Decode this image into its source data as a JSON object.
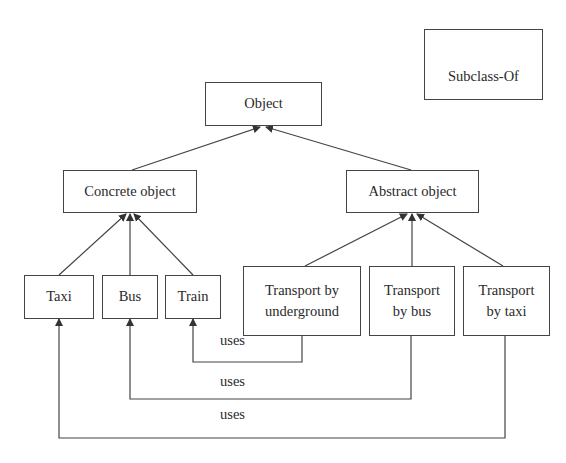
{
  "diagram": {
    "type": "class-hierarchy",
    "legend": {
      "arrow_label": "Subclass-Of"
    },
    "nodes": {
      "object": {
        "label": "Object"
      },
      "concrete": {
        "label": "Concrete object"
      },
      "abstract": {
        "label": "Abstract object"
      },
      "taxi": {
        "label": "Taxi"
      },
      "bus": {
        "label": "Bus"
      },
      "train": {
        "label": "Train"
      },
      "t_underground": {
        "line1": "Transport by",
        "line2": "underground"
      },
      "t_bus": {
        "line1": "Transport",
        "line2": "by bus"
      },
      "t_taxi": {
        "line1": "Transport",
        "line2": "by taxi"
      }
    },
    "edges": [
      {
        "from": "Concrete object",
        "to": "Object",
        "type": "Subclass-Of"
      },
      {
        "from": "Abstract object",
        "to": "Object",
        "type": "Subclass-Of"
      },
      {
        "from": "Taxi",
        "to": "Concrete object",
        "type": "Subclass-Of"
      },
      {
        "from": "Bus",
        "to": "Concrete object",
        "type": "Subclass-Of"
      },
      {
        "from": "Train",
        "to": "Concrete object",
        "type": "Subclass-Of"
      },
      {
        "from": "Transport by underground",
        "to": "Abstract object",
        "type": "Subclass-Of"
      },
      {
        "from": "Transport by bus",
        "to": "Abstract object",
        "type": "Subclass-Of"
      },
      {
        "from": "Transport by taxi",
        "to": "Abstract object",
        "type": "Subclass-Of"
      },
      {
        "from": "Transport by underground",
        "to": "Train",
        "type": "uses"
      },
      {
        "from": "Transport by bus",
        "to": "Bus",
        "type": "uses"
      },
      {
        "from": "Transport by taxi",
        "to": "Taxi",
        "type": "uses"
      }
    ],
    "relation_labels": {
      "uses_train": "uses",
      "uses_bus": "uses",
      "uses_taxi": "uses"
    },
    "colors": {
      "line": "#444444",
      "background": "#ffffff",
      "text": "#2a2a2a"
    }
  }
}
